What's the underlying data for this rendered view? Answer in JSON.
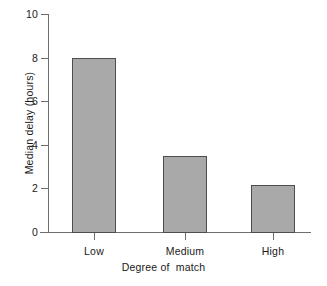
{
  "chart_data": {
    "type": "bar",
    "title": "",
    "subtitle": "",
    "categories": [
      "Low",
      "Medium",
      "High"
    ],
    "values": [
      8.0,
      3.5,
      2.15
    ],
    "xlabel": "Degree of  match",
    "ylabel": "Median delay (hours)",
    "ylim": [
      0,
      10
    ],
    "yticks": [
      "0",
      "2",
      "4",
      "6",
      "8",
      "10"
    ],
    "ytick_values": [
      0,
      2,
      4,
      6,
      8,
      10
    ],
    "grid": false,
    "legend": null,
    "annotations": [],
    "colors": {
      "bar_fill": "#a9a9a9",
      "bar_stroke": "#4d4d4d",
      "axis": "#6e6e6e",
      "text": "#1a1a1a",
      "background": "#ffffff"
    }
  }
}
